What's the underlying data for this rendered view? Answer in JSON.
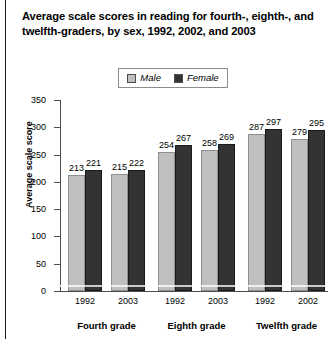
{
  "figure": {
    "title": "Average scale scores in reading for fourth-, eighth-, and twelfth-graders, by sex, 1992, 2002, and 2003"
  },
  "legend": {
    "male_label": "Male",
    "female_label": "Female",
    "male_color": "#BFBFBF",
    "female_color": "#333333",
    "position": "top-center"
  },
  "chart_data": {
    "type": "bar",
    "title": "Average scale scores in reading for fourth-, eighth-, and twelfth-graders, by sex, 1992, 2002, and 2003",
    "xlabel": "",
    "ylabel": "Average scale score",
    "ylim": [
      0,
      350
    ],
    "yticks": [
      0,
      50,
      100,
      150,
      200,
      250,
      300,
      350
    ],
    "grid": false,
    "legend": [
      "Male",
      "Female"
    ],
    "categories": [
      "1992",
      "2003",
      "1992",
      "2003",
      "1992",
      "2002"
    ],
    "groups": [
      {
        "label": "Fourth grade",
        "years": [
          "1992",
          "2003"
        ]
      },
      {
        "label": "Eighth grade",
        "years": [
          "1992",
          "2003"
        ]
      },
      {
        "label": "Twelfth grade",
        "years": [
          "1992",
          "2002"
        ]
      }
    ],
    "series": [
      {
        "name": "Male",
        "color": "#BFBFBF",
        "values": [
          213,
          215,
          254,
          258,
          287,
          279
        ]
      },
      {
        "name": "Female",
        "color": "#333333",
        "values": [
          221,
          222,
          267,
          269,
          297,
          295
        ]
      }
    ],
    "bars": [
      {
        "group": "Fourth grade",
        "year": "1992",
        "sex": "Male",
        "value": 213
      },
      {
        "group": "Fourth grade",
        "year": "1992",
        "sex": "Female",
        "value": 221
      },
      {
        "group": "Fourth grade",
        "year": "2003",
        "sex": "Male",
        "value": 215
      },
      {
        "group": "Fourth grade",
        "year": "2003",
        "sex": "Female",
        "value": 222
      },
      {
        "group": "Eighth grade",
        "year": "1992",
        "sex": "Male",
        "value": 254
      },
      {
        "group": "Eighth grade",
        "year": "1992",
        "sex": "Female",
        "value": 267
      },
      {
        "group": "Eighth grade",
        "year": "2003",
        "sex": "Male",
        "value": 258
      },
      {
        "group": "Eighth grade",
        "year": "2003",
        "sex": "Female",
        "value": 269
      },
      {
        "group": "Twelfth grade",
        "year": "1992",
        "sex": "Male",
        "value": 287
      },
      {
        "group": "Twelfth grade",
        "year": "1992",
        "sex": "Female",
        "value": 297
      },
      {
        "group": "Twelfth grade",
        "year": "2002",
        "sex": "Male",
        "value": 279
      },
      {
        "group": "Twelfth grade",
        "year": "2002",
        "sex": "Female",
        "value": 295
      }
    ]
  }
}
